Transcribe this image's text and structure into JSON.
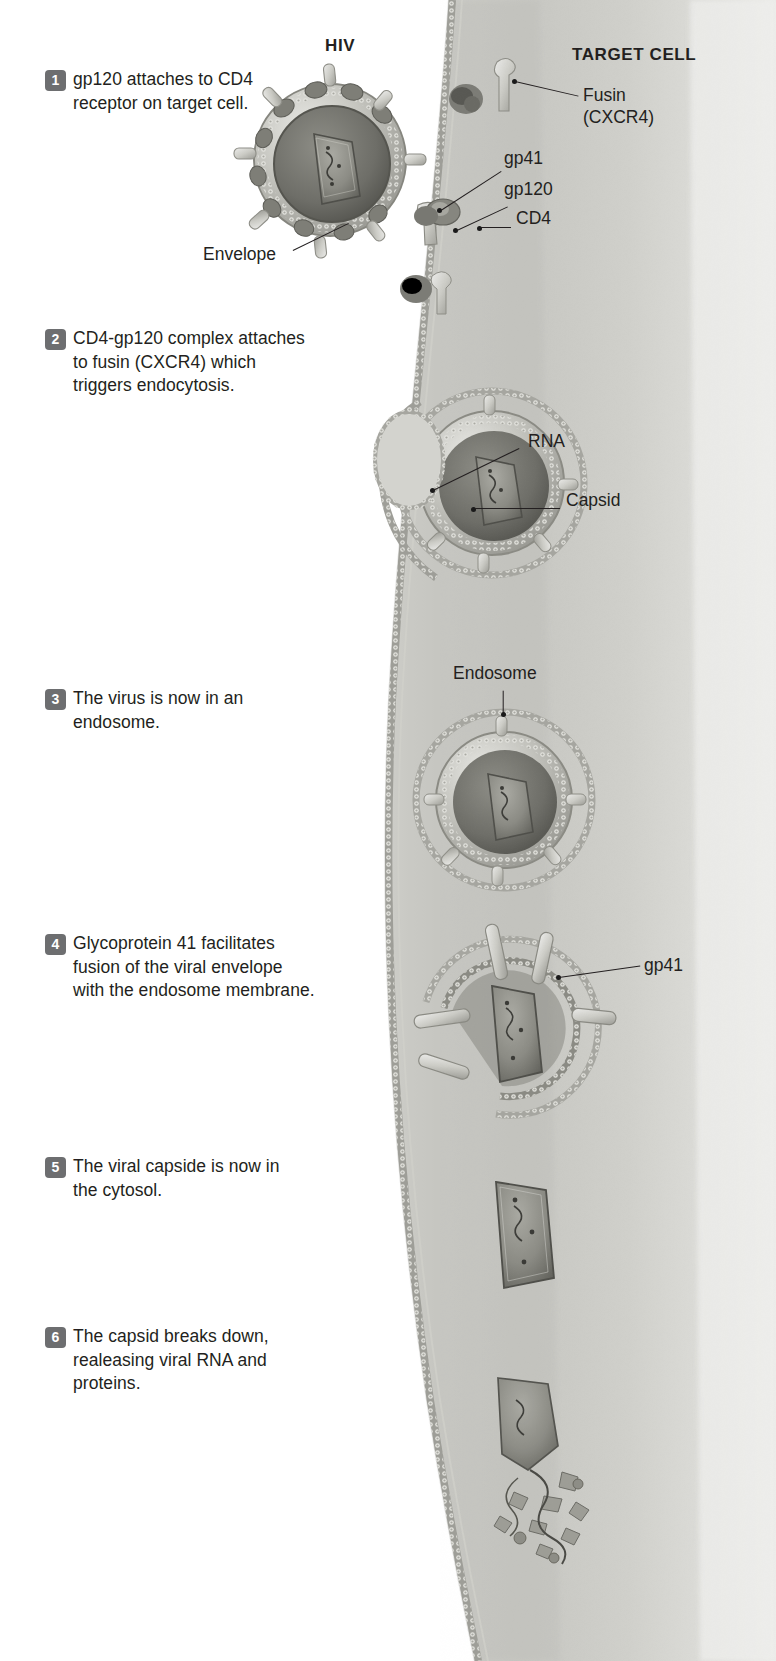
{
  "figure": {
    "type": "biology-diagram",
    "headings": {
      "left": "HIV",
      "right": "TARGET CELL"
    },
    "steps": [
      {
        "number": "1",
        "text": "gp120 attaches to CD4 receptor on target cell."
      },
      {
        "number": "2",
        "text": "CD4-gp120 complex attaches to fusin (CXCR4) which triggers endocytosis."
      },
      {
        "number": "3",
        "text": "The virus is now in an endosome."
      },
      {
        "number": "4",
        "text": "Glycoprotein 41 facilitates fusion of the viral envelope with the endosome membrane."
      },
      {
        "number": "5",
        "text": "The viral capside is now in the cytosol."
      },
      {
        "number": "6",
        "text": "The capsid breaks down, realeasing viral RNA and proteins."
      }
    ],
    "callouts": [
      {
        "id": "fusin",
        "line1": "Fusin",
        "line2": "(CXCR4)"
      },
      {
        "id": "gp41_top",
        "line1": "gp41",
        "line2": ""
      },
      {
        "id": "gp120",
        "line1": "gp120",
        "line2": ""
      },
      {
        "id": "cd4",
        "line1": "CD4",
        "line2": ""
      },
      {
        "id": "envelope",
        "line1": "Envelope",
        "line2": ""
      },
      {
        "id": "rna",
        "line1": "RNA",
        "line2": ""
      },
      {
        "id": "capsid",
        "line1": "Capsid",
        "line2": ""
      },
      {
        "id": "endosome",
        "line1": "Endosome",
        "line2": ""
      },
      {
        "id": "gp41_step4",
        "line1": "gp41",
        "line2": ""
      }
    ],
    "colors": {
      "text": "#231f20",
      "step_badge": "#6d6e70",
      "cytoplasm_light": "#e6e6e3",
      "cytoplasm_mid": "#cfcfcb",
      "membrane": "#b9b9b3",
      "virus_shell": "#b0b0aa",
      "capsid": "#8a8a84",
      "background": "#ffffff"
    }
  }
}
